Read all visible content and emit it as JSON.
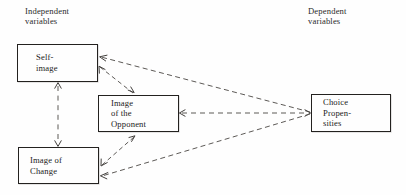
{
  "figure": {
    "background_color": "#fefefe",
    "line_color": "#5d5a57",
    "box_border_color": "#23211f",
    "text_color": "#1b1b1b"
  },
  "headings": {
    "independent": "Independent\nvariables",
    "dependent": "Dependent\nvariables"
  },
  "nodes": [
    {
      "id": "self-image",
      "label": "Self-\nimage"
    },
    {
      "id": "image-of-the-opponent",
      "label": "Image\nof the\nOpponent"
    },
    {
      "id": "image-of-change",
      "label": "Image of\nChange"
    },
    {
      "id": "choice-propensities",
      "label": "Choice\nPropen-\nsities"
    }
  ],
  "edges": [
    {
      "id": "choice-to-self-image",
      "from": "choice-propensities",
      "to": "self-image",
      "style": "dashed",
      "direction": "single",
      "arrow_at": "self-image"
    },
    {
      "id": "self-image-to-opponent",
      "from": "self-image",
      "to": "image-of-the-opponent",
      "style": "dashed",
      "direction": "double",
      "arrow_at": "both"
    },
    {
      "id": "self-image-to-change",
      "from": "self-image",
      "to": "image-of-change",
      "style": "dashed",
      "direction": "double",
      "arrow_at": "both"
    },
    {
      "id": "change-to-opponent",
      "from": "image-of-change",
      "to": "image-of-the-opponent",
      "style": "dashed",
      "direction": "double",
      "arrow_at": "both"
    },
    {
      "id": "opponent-to-choice",
      "from": "image-of-the-opponent",
      "to": "choice-propensities",
      "style": "dashed",
      "direction": "double",
      "arrow_at": "both"
    },
    {
      "id": "choice-to-image-of-change",
      "from": "choice-propensities",
      "to": "image-of-change",
      "style": "dashed",
      "direction": "single",
      "arrow_at": "image-of-change"
    }
  ]
}
